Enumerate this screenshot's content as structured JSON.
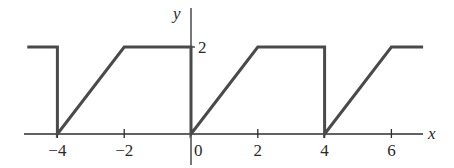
{
  "chart_data": {
    "type": "line",
    "title": "",
    "xlabel": "x",
    "ylabel": "y",
    "xlim": [
      -5,
      7
    ],
    "ylim": [
      0,
      2
    ],
    "grid": false,
    "legend": null,
    "x_ticks": [
      -4,
      -2,
      0,
      2,
      4,
      6
    ],
    "x_tick_labels": [
      "−4",
      "−2",
      "0",
      "2",
      "4",
      "6"
    ],
    "y_ticks": [
      2
    ],
    "y_tick_labels": [
      "2"
    ],
    "series": [
      {
        "name": "f(x)",
        "description": "Periodic function with period 6: jumps to 0 at x = -4, 0, 4 (hmm: period 4? see points) then rises linearly to 2 over 2 units, stays at 2 for 2 units",
        "points": [
          [
            -4.9,
            2
          ],
          [
            -4,
            2
          ],
          [
            -4,
            0
          ],
          [
            -2,
            2
          ],
          [
            0,
            2
          ],
          [
            0,
            0
          ],
          [
            2,
            2
          ],
          [
            4,
            2
          ],
          [
            4,
            0
          ],
          [
            6,
            2
          ],
          [
            6.95,
            2
          ]
        ]
      }
    ]
  },
  "axes": {
    "x_label": "x",
    "y_label": "y"
  }
}
